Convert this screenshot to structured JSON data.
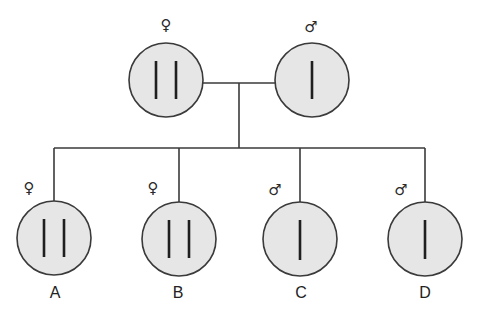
{
  "diagram": {
    "type": "pedigree",
    "colors": {
      "fill": "#e6e6e6",
      "stroke": "#3a3a3a",
      "chromosome": "#1f1f1f"
    },
    "parents": [
      {
        "id": "mother",
        "sex_symbol": "♀",
        "sex": "female",
        "chromosomes": 2,
        "cx": 166,
        "cy": 80
      },
      {
        "id": "father",
        "sex_symbol": "♂",
        "sex": "male",
        "chromosomes": 1,
        "cx": 312,
        "cy": 80
      }
    ],
    "children": [
      {
        "id": "A",
        "label": "A",
        "sex_symbol": "♀",
        "sex": "female",
        "chromosomes": 2,
        "cx": 54,
        "cy": 238
      },
      {
        "id": "B",
        "label": "B",
        "sex_symbol": "♀",
        "sex": "female",
        "chromosomes": 2,
        "cx": 179,
        "cy": 239
      },
      {
        "id": "C",
        "label": "C",
        "sex_symbol": "♂",
        "sex": "male",
        "chromosomes": 1,
        "cx": 300,
        "cy": 239
      },
      {
        "id": "D",
        "label": "D",
        "sex_symbol": "♂",
        "sex": "male",
        "chromosomes": 1,
        "cx": 425,
        "cy": 239
      }
    ]
  }
}
